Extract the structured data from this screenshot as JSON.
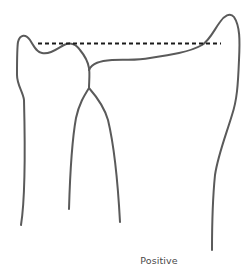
{
  "diagram": {
    "caption": "Positive",
    "colors": {
      "stroke": "#5a5a5a",
      "dashed": "#1a1a1a",
      "caption": "#4a4a4a",
      "background": "#ffffff"
    },
    "elements": [
      {
        "name": "left-bone-outline",
        "type": "curve"
      },
      {
        "name": "left-leg-outline",
        "type": "curve"
      },
      {
        "name": "right-leg-outline",
        "type": "curve"
      },
      {
        "name": "right-bone-outline",
        "type": "curve"
      },
      {
        "name": "reference-dashed-line",
        "type": "dashed-line"
      }
    ]
  }
}
